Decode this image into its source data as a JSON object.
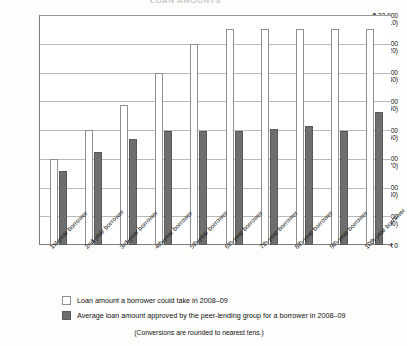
{
  "title_faint": "LOAN AMOUNTS",
  "chart_data": {
    "type": "bar",
    "title": "",
    "xlabel": "",
    "ylabel": "",
    "ylim": [
      0,
      32000
    ],
    "grid": true,
    "legend_position": "bottom",
    "categories": [
      "1st-year borrower",
      "2nd-year borrower",
      "3rd-year borrower",
      "4th-year borrower",
      "5th-year borrower",
      "6th-year borrower",
      "7th-year borrower",
      "8th-year borrower",
      "9th-year borrower",
      "10th-year borrower"
    ],
    "ytick_labels": [
      {
        "inr": "₹ 32,000",
        "usd": "($710)",
        "value": 32000
      },
      {
        "inr": "₹ 28,000",
        "usd": "($620)",
        "value": 28000
      },
      {
        "inr": "₹ 24,000",
        "usd": "($530)",
        "value": 24000
      },
      {
        "inr": "₹ 20,000",
        "usd": "($440)",
        "value": 20000
      },
      {
        "inr": "₹ 16,000",
        "usd": "($350)",
        "value": 16000
      },
      {
        "inr": "₹ 12,000",
        "usd": "($270)",
        "value": 12000
      },
      {
        "inr": "₹ 8,000",
        "usd": "($180)",
        "value": 8000
      },
      {
        "inr": "₹ 4,000",
        "usd": "($90)",
        "value": 4000
      },
      {
        "inr": "₹ 0",
        "usd": "",
        "value": 0
      }
    ],
    "series": [
      {
        "name": "Loan amount a borrower could take in 2008–09",
        "color": "#ffffff",
        "values": [
          12000,
          16000,
          19500,
          24000,
          28000,
          30000,
          30000,
          30000,
          30000,
          30000
        ]
      },
      {
        "name": "Average loan amount approved by the peer-lending group for a borrower in 2008–09",
        "color": "#6e6e6e",
        "values": [
          10300,
          13000,
          14800,
          15800,
          15800,
          15800,
          16200,
          16500,
          15800,
          18500
        ]
      }
    ],
    "note": "(Conversions are rounded to nearest tens.)"
  },
  "legend": {
    "items": [
      {
        "label": "Loan amount a borrower could take in 2008–09",
        "swatch": "light"
      },
      {
        "label": "Average loan amount approved by the peer-lending group for a borrower in 2008–09",
        "swatch": "dark"
      }
    ],
    "note": "(Conversions are rounded to nearest tens.)"
  }
}
